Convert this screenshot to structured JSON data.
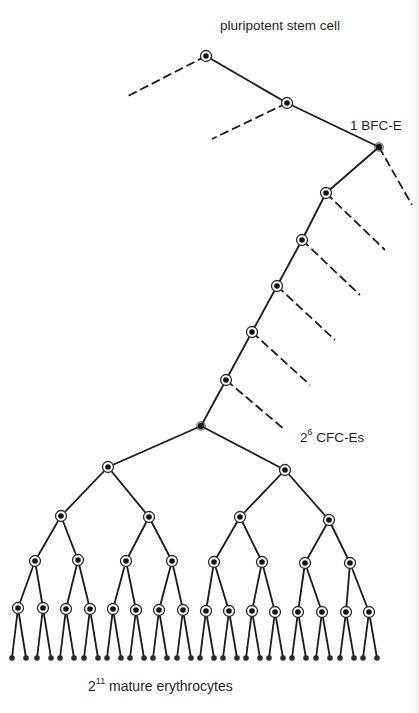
{
  "labels": {
    "stem_cell": "pluripotent stem cell",
    "bfc_count": "1",
    "bfc_name": "BFC-E",
    "cfc_base": "2",
    "cfc_exp": "6",
    "cfc_name": "CFC-Es",
    "ery_base": "2",
    "ery_exp": "11",
    "ery_name": "mature erythrocytes"
  },
  "colors": {
    "line": "#1a1a1a",
    "node_core": "#111111",
    "background": "#ffffff"
  },
  "tree": {
    "stem_node": [
      206,
      56
    ],
    "stem_branch_dashed_end": [
      128,
      96
    ],
    "second_node": [
      287,
      103
    ],
    "second_branch_dashed_end": [
      212,
      139
    ],
    "bfc_node": [
      379,
      147
    ],
    "bfc_dashed_end": [
      412,
      205
    ],
    "chain_nodes": [
      [
        326,
        193
      ],
      [
        302,
        240
      ],
      [
        277,
        286
      ],
      [
        252,
        332
      ],
      [
        226,
        380
      ]
    ],
    "chain_dashed_ends": [
      [
        385,
        250
      ],
      [
        360,
        295
      ],
      [
        335,
        340
      ],
      [
        310,
        385
      ],
      [
        285,
        430
      ]
    ],
    "cfc_root": [
      201,
      426
    ],
    "level1": [
      [
        108,
        467
      ],
      [
        285,
        470
      ]
    ],
    "level2": [
      [
        61,
        516
      ],
      [
        149,
        517
      ],
      [
        240,
        517
      ],
      [
        329,
        520
      ]
    ],
    "level3": [
      [
        35,
        561
      ],
      [
        78,
        560
      ],
      [
        126,
        561
      ],
      [
        172,
        561
      ],
      [
        214,
        562
      ],
      [
        262,
        562
      ],
      [
        305,
        563
      ],
      [
        350,
        563
      ]
    ],
    "level4": [
      [
        18,
        608
      ],
      [
        43,
        608
      ],
      [
        66,
        609
      ],
      [
        90,
        609
      ],
      [
        113,
        609
      ],
      [
        136,
        610
      ],
      [
        159,
        610
      ],
      [
        183,
        610
      ],
      [
        206,
        611
      ],
      [
        229,
        611
      ],
      [
        252,
        611
      ],
      [
        275,
        612
      ],
      [
        298,
        612
      ],
      [
        322,
        612
      ],
      [
        346,
        612
      ],
      [
        369,
        612
      ]
    ],
    "leaf_y": 658,
    "leaf_spread": 6
  }
}
